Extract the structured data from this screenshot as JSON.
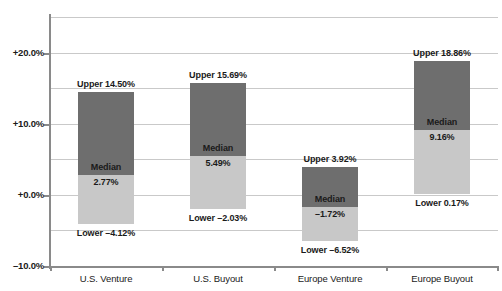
{
  "chart_data": {
    "type": "bar",
    "title": "",
    "subtitle": "",
    "xlabel": "",
    "ylabel": "",
    "ylim": [
      -10.0,
      25.0
    ],
    "grid": true,
    "legend": false,
    "y_ticks": [
      {
        "value": 20.0,
        "label": "+20.0%"
      },
      {
        "value": 10.0,
        "label": "+10.0%"
      },
      {
        "value": 0.0,
        "label": "+0.0%"
      },
      {
        "value": -10.0,
        "label": "–10.0%"
      }
    ],
    "y_gridlines": [
      25.0,
      20.0,
      15.0,
      10.0,
      5.0,
      0.0,
      -5.0
    ],
    "categories": [
      "U.S. Venture",
      "U.S. Buyout",
      "Europe Venture",
      "Europe Buyout"
    ],
    "series": [
      {
        "name": "Upper",
        "values": [
          14.5,
          15.69,
          3.92,
          18.86
        ]
      },
      {
        "name": "Median",
        "values": [
          2.77,
          5.49,
          -1.72,
          9.16
        ]
      },
      {
        "name": "Lower",
        "values": [
          -4.12,
          -2.03,
          -6.52,
          0.17
        ]
      }
    ],
    "bars": [
      {
        "category": "U.S. Venture",
        "upper": 14.5,
        "median": 2.77,
        "lower": -4.12,
        "upper_label": "Upper 14.50%",
        "median_word": "Median",
        "median_label": "2.77%",
        "lower_label": "Lower –4.12%"
      },
      {
        "category": "U.S. Buyout",
        "upper": 15.69,
        "median": 5.49,
        "lower": -2.03,
        "upper_label": "Upper 15.69%",
        "median_word": "Median",
        "median_label": "5.49%",
        "lower_label": "Lower –2.03%"
      },
      {
        "category": "Europe Venture",
        "upper": 3.92,
        "median": -1.72,
        "lower": -6.52,
        "upper_label": "Upper 3.92%",
        "median_word": "Median",
        "median_label": "–1.72%",
        "lower_label": "Lower –6.52%"
      },
      {
        "category": "Europe Buyout",
        "upper": 18.86,
        "median": 9.16,
        "lower": 0.17,
        "upper_label": "Upper 18.86%",
        "median_word": "Median",
        "median_label": "9.16%",
        "lower_label": "Lower 0.17%"
      }
    ],
    "colors": {
      "upper_fill": "#6e6e6e",
      "lower_fill": "#c8c8c8",
      "gridline": "#c9c9c9",
      "axis": "#8a8a8a",
      "text": "#1a1a1a",
      "background": "#ffffff"
    }
  }
}
